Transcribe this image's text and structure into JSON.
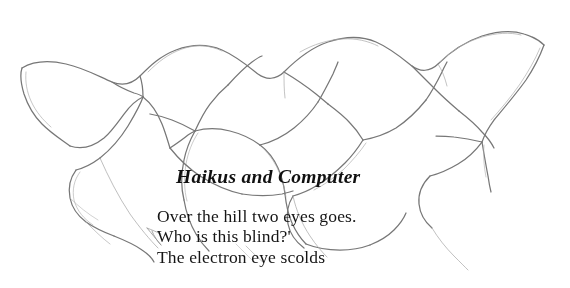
{
  "page": {
    "background_color": "#ffffff",
    "width": 570,
    "height": 288
  },
  "artwork": {
    "name": "pencil-sketch",
    "description": "Loose graphite pencil line drawing of a horizontal chain of overlapping scalloped wave-like organic shapes spanning the upper half of the page, with thin tendril lines trailing downward over the text.",
    "medium": "pencil",
    "line_color": "#6b6b6b",
    "line_color_light": "#9a9a9a"
  },
  "poem": {
    "title": "Haikus and Computer",
    "title_color": "#101010",
    "text_color": "#151515",
    "lines": [
      "Over the hill two eyes goes.",
      "Who is this blind?'",
      "The electron eye scolds"
    ]
  }
}
